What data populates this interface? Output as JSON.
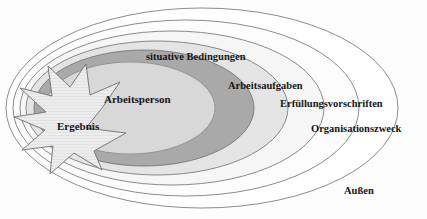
{
  "diagram": {
    "type": "concentric-ellipses",
    "palette": {
      "background": "#fdfdfd",
      "stroke": "#6a6a6a",
      "ring_outer": "#ffffff",
      "ring_organisationszweck": "#fbfbfb",
      "ring_erfuellungsvorschriften": "#f5f5f5",
      "ring_arbeitsaufgaben": "#e3e3e3",
      "ring_situative_bedingungen": "#a9a9a9",
      "core_arbeitsperson": "#d7d7d7",
      "star_ergebnis": "#ededed",
      "text": "#161616"
    },
    "labels": {
      "situative_bedingungen": "situative Bedingungen",
      "arbeitsaufgaben": "Arbeitsaufgaben",
      "erfuellungsvorschriften": "Erfüllungsvorschriften",
      "organisationszweck": "Organisationszweck",
      "aussen": "Außen",
      "arbeitsperson": "Arbeitsperson",
      "ergebnis": "Ergebnis"
    },
    "layers": [
      {
        "name": "aussen",
        "label": "Außen",
        "order": 0,
        "fill": "#ffffff"
      },
      {
        "name": "organisationszweck",
        "label": "Organisationszweck",
        "order": 1,
        "fill": "#fbfbfb"
      },
      {
        "name": "erfuellungsvorschriften",
        "label": "Erfüllungsvorschriften",
        "order": 2,
        "fill": "#f5f5f5"
      },
      {
        "name": "arbeitsaufgaben",
        "label": "Arbeitsaufgaben",
        "order": 3,
        "fill": "#e3e3e3"
      },
      {
        "name": "situative-bedingungen",
        "label": "situative Bedingungen",
        "order": 4,
        "fill": "#a9a9a9"
      },
      {
        "name": "arbeitsperson",
        "label": "Arbeitsperson",
        "order": 5,
        "fill": "#d7d7d7"
      },
      {
        "name": "ergebnis",
        "label": "Ergebnis",
        "order": 6,
        "fill": "#ededed"
      }
    ]
  }
}
